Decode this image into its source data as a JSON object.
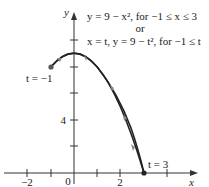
{
  "figure": {
    "equation_line1": "y = 9 − x², for −1 ≤ x ≤ 3",
    "equation_or": "or",
    "equation_line2": "x = t, y = 9 − t², for −1 ≤ t",
    "start_label": "t = −1",
    "end_label": "t = 3",
    "x_axis_label": "x",
    "y_axis_label": "y",
    "x_ticks": [
      "−2",
      "0",
      "2"
    ],
    "y_ticks": [
      "4"
    ],
    "curve_color": "#222222",
    "arrow_color": "#888888"
  }
}
